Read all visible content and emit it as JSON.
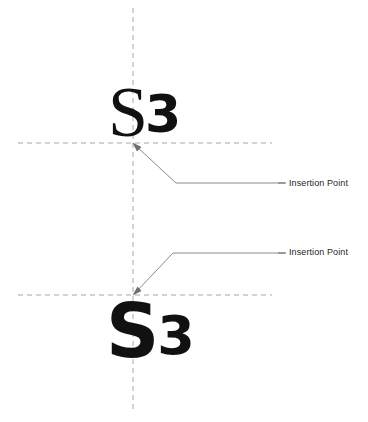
{
  "diagram": {
    "background_color": "#ffffff",
    "width": 368,
    "height": 422,
    "guide_color": "#a8a8a8",
    "leader_color": "#8a8a8a",
    "text_color": "#111111",
    "label_color": "#262626"
  },
  "samples": {
    "top": {
      "name": "top-text-sample",
      "letter_s": "S",
      "letter_3": "3",
      "full_text": "S3",
      "alignment": "baseline-on-guide",
      "insertion_x": 133,
      "insertion_y": 143
    },
    "bottom": {
      "name": "bottom-text-sample",
      "letter_s": "S",
      "letter_3": "3",
      "full_text": "S3",
      "alignment": "top-on-guide",
      "insertion_x": 133,
      "insertion_y": 295
    }
  },
  "callouts": [
    {
      "id": "callout-top",
      "label": "Insertion Point"
    },
    {
      "id": "callout-bottom",
      "label": "Insertion Point"
    }
  ],
  "guides": {
    "vertical": {
      "x": 133,
      "y1": 8,
      "y2": 411
    },
    "horizontal_top": {
      "y": 143,
      "x1": 18,
      "x2": 272
    },
    "horizontal_bottom": {
      "y": 295,
      "x1": 18,
      "x2": 272
    }
  }
}
